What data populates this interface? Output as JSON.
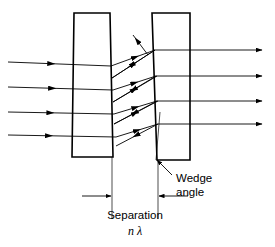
{
  "figure": {
    "type": "optics-ray-diagram",
    "background_color": "#ffffff",
    "line_color": "#000000",
    "plate_stroke_width": 1.6,
    "ray_stroke_width": 0.9
  },
  "labels": {
    "wedge_angle_line1": "Wedge",
    "wedge_angle_line2": "angle",
    "separation": "Separation",
    "separation_value": "n λ"
  },
  "plates": [
    {
      "name": "left-plate",
      "points": "74,13 110,13 113,157 72,157"
    },
    {
      "name": "right-plate",
      "points": "152,13 190,13 190,160 157,160"
    }
  ],
  "chart_data": {
    "type": "diagram",
    "title": "",
    "incoming_rays": [
      {
        "x1": 8,
        "y1": 62,
        "x2": 111,
        "y2": 66,
        "arrow_at": 0.42
      },
      {
        "x1": 8,
        "y1": 87,
        "x2": 113,
        "y2": 90,
        "arrow_at": 0.42
      },
      {
        "x1": 8,
        "y1": 112,
        "x2": 114,
        "y2": 114,
        "arrow_at": 0.4
      },
      {
        "x1": 8,
        "y1": 135,
        "x2": 116,
        "y2": 137,
        "arrow_at": 0.38
      }
    ],
    "internal_rays": [
      {
        "x1": 111,
        "y1": 66,
        "x2": 155,
        "y2": 50,
        "arrow_at": 0.55
      },
      {
        "x1": 155,
        "y1": 50,
        "x2": 112,
        "y2": 78,
        "arrow_at": 0.55
      },
      {
        "x1": 112,
        "y1": 78,
        "x2": 155,
        "y2": 50,
        "arrow_at": 0.5
      },
      {
        "x1": 113,
        "y1": 90,
        "x2": 156,
        "y2": 76,
        "arrow_at": 0.5
      },
      {
        "x1": 156,
        "y1": 76,
        "x2": 113,
        "y2": 102,
        "arrow_at": 0.52
      },
      {
        "x1": 113,
        "y1": 102,
        "x2": 157,
        "y2": 76,
        "arrow_at": 0.48
      },
      {
        "x1": 114,
        "y1": 114,
        "x2": 157,
        "y2": 101,
        "arrow_at": 0.5
      },
      {
        "x1": 157,
        "y1": 101,
        "x2": 114,
        "y2": 124,
        "arrow_at": 0.52
      },
      {
        "x1": 114,
        "y1": 124,
        "x2": 158,
        "y2": 101,
        "arrow_at": 0.48
      },
      {
        "x1": 116,
        "y1": 137,
        "x2": 158,
        "y2": 124,
        "arrow_at": 0.5
      },
      {
        "x1": 158,
        "y1": 124,
        "x2": 116,
        "y2": 146,
        "arrow_at": 0.52
      }
    ],
    "escaping_ray": {
      "x1": 148,
      "y1": 55,
      "x2": 133,
      "y2": 35,
      "arrow_at": 0.72
    },
    "outgoing_rays": [
      {
        "x1": 155,
        "y1": 50,
        "x2": 262,
        "y2": 50
      },
      {
        "x1": 156,
        "y1": 76,
        "x2": 262,
        "y2": 76
      },
      {
        "x1": 157,
        "y1": 101,
        "x2": 262,
        "y2": 101
      },
      {
        "x1": 158,
        "y1": 124,
        "x2": 262,
        "y2": 124
      }
    ],
    "extension_lines": [
      {
        "name": "left-extension",
        "x1": 112,
        "y1": 157,
        "x2": 112,
        "y2": 219
      },
      {
        "name": "right-extension",
        "x1": 158,
        "y1": 160,
        "x2": 158,
        "y2": 219
      }
    ],
    "dimension_arrows": [
      {
        "name": "left-dim-arrow",
        "x1": 82,
        "y1": 196,
        "x2": 111,
        "y2": 196
      },
      {
        "name": "right-dim-arrow",
        "x1": 188,
        "y1": 196,
        "x2": 159,
        "y2": 196
      }
    ],
    "wedge_reference_line": {
      "x1": 160,
      "y1": 112,
      "x2": 156,
      "y2": 160
    },
    "wedge_pointer": {
      "x1": 172,
      "y1": 175,
      "x2": 157,
      "y2": 160
    }
  }
}
